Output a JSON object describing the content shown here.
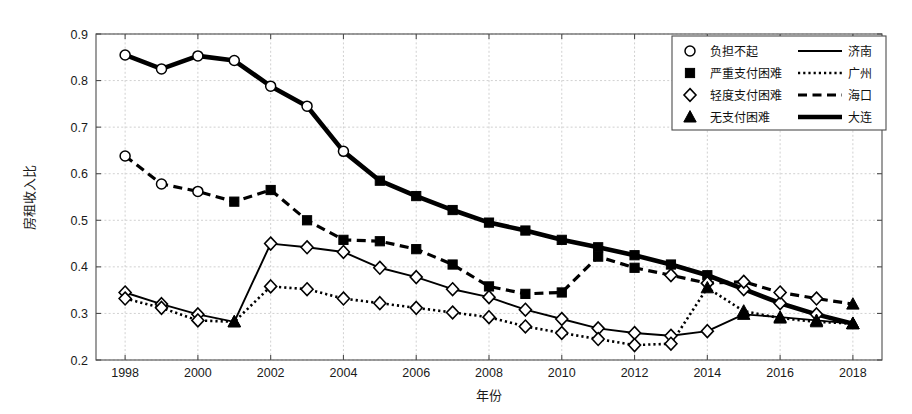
{
  "chart_data": {
    "type": "line",
    "title": "",
    "xlabel": "年份",
    "ylabel": "房租收入比",
    "xlim": [
      1997.2,
      2018.8
    ],
    "ylim": [
      0.2,
      0.9
    ],
    "grid": true,
    "x_ticks": [
      1998,
      2000,
      2002,
      2004,
      2006,
      2008,
      2010,
      2012,
      2014,
      2016,
      2018
    ],
    "y_ticks": [
      0.2,
      0.3,
      0.4,
      0.5,
      0.6,
      0.7,
      0.8,
      0.9
    ],
    "x": [
      1998,
      1999,
      2000,
      2001,
      2002,
      2003,
      2004,
      2005,
      2006,
      2007,
      2008,
      2009,
      2010,
      2011,
      2012,
      2013,
      2014,
      2015,
      2016,
      2017,
      2018
    ],
    "legend": {
      "position": "top-right",
      "marker_entries": [
        {
          "marker": "circle-open",
          "label": "负担不起"
        },
        {
          "marker": "square-filled",
          "label": "严重支付困难"
        },
        {
          "marker": "diamond-open",
          "label": "轻度支付困难"
        },
        {
          "marker": "triangle-filled",
          "label": "无支付困难"
        }
      ],
      "line_entries": [
        {
          "style": "solid",
          "label": "济南"
        },
        {
          "style": "dotted",
          "label": "广州"
        },
        {
          "style": "dashed",
          "label": "海口"
        },
        {
          "style": "thick-solid",
          "label": "大连"
        }
      ]
    },
    "series": [
      {
        "name": "大连",
        "line_style": "thick-solid",
        "values": [
          0.855,
          0.825,
          0.853,
          0.843,
          0.788,
          0.745,
          0.648,
          0.585,
          0.552,
          0.522,
          0.495,
          0.478,
          0.458,
          0.442,
          0.425,
          0.405,
          0.382,
          0.352,
          0.322,
          0.298,
          0.278
        ],
        "markers": [
          "circle-open",
          "circle-open",
          "circle-open",
          "circle-open",
          "circle-open",
          "circle-open",
          "circle-open",
          "square-filled",
          "square-filled",
          "square-filled",
          "square-filled",
          "square-filled",
          "square-filled",
          "square-filled",
          "square-filled",
          "square-filled",
          "square-filled",
          "diamond-open",
          "diamond-open",
          "diamond-open",
          "triangle-filled"
        ]
      },
      {
        "name": "海口",
        "line_style": "dashed",
        "values": [
          0.638,
          0.578,
          0.562,
          0.54,
          0.565,
          0.5,
          0.458,
          0.455,
          0.438,
          0.405,
          0.358,
          0.342,
          0.345,
          0.422,
          0.398,
          0.382,
          0.365,
          0.368,
          0.345,
          0.332,
          0.32
        ],
        "markers": [
          "circle-open",
          "circle-open",
          "circle-open",
          "square-filled",
          "square-filled",
          "square-filled",
          "square-filled",
          "square-filled",
          "square-filled",
          "square-filled",
          "square-filled",
          "square-filled",
          "square-filled",
          "square-filled",
          "square-filled",
          "diamond-open",
          "diamond-open",
          "diamond-open",
          "diamond-open",
          "diamond-open",
          "triangle-filled"
        ]
      },
      {
        "name": "济南",
        "line_style": "solid",
        "values": [
          0.345,
          0.32,
          0.298,
          0.282,
          0.45,
          0.442,
          0.432,
          0.398,
          0.378,
          0.352,
          0.335,
          0.308,
          0.288,
          0.268,
          0.258,
          0.252,
          0.262,
          0.298,
          0.292,
          0.285,
          0.278
        ],
        "markers": [
          "diamond-open",
          "diamond-open",
          "diamond-open",
          "triangle-filled",
          "diamond-open",
          "diamond-open",
          "diamond-open",
          "diamond-open",
          "diamond-open",
          "diamond-open",
          "diamond-open",
          "diamond-open",
          "diamond-open",
          "diamond-open",
          "diamond-open",
          "diamond-open",
          "diamond-open",
          "triangle-filled",
          "triangle-filled",
          "triangle-filled",
          "triangle-filled"
        ]
      },
      {
        "name": "广州",
        "line_style": "dotted",
        "values": [
          0.332,
          0.312,
          0.285,
          0.282,
          0.358,
          0.352,
          0.332,
          0.322,
          0.312,
          0.302,
          0.292,
          0.272,
          0.258,
          0.245,
          0.232,
          0.235,
          0.355,
          0.305,
          0.29,
          0.282,
          0.278
        ],
        "markers": [
          "diamond-open",
          "diamond-open",
          "diamond-open",
          "triangle-filled",
          "diamond-open",
          "diamond-open",
          "diamond-open",
          "diamond-open",
          "diamond-open",
          "diamond-open",
          "diamond-open",
          "diamond-open",
          "diamond-open",
          "diamond-open",
          "diamond-open",
          "diamond-open",
          "triangle-filled",
          "triangle-filled",
          "triangle-filled",
          "triangle-filled",
          "triangle-filled"
        ]
      }
    ]
  },
  "colors": {
    "ink": "#000000",
    "grid": "#cccccc",
    "axis": "#4d4d4d",
    "background": "#ffffff"
  }
}
